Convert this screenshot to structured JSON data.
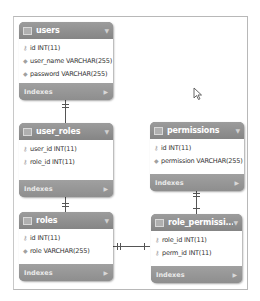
{
  "diagram": {
    "tables": [
      {
        "name": "users",
        "columns": [
          {
            "icon": "key",
            "text": "id INT(11)"
          },
          {
            "icon": "diamond",
            "text": "user_name VARCHAR(255)"
          },
          {
            "icon": "diamond",
            "text": "password VARCHAR(255)"
          }
        ],
        "indexes_label": "Indexes"
      },
      {
        "name": "user_roles",
        "columns": [
          {
            "icon": "key",
            "text": "user_id INT(11)"
          },
          {
            "icon": "key",
            "text": "role_id INT(11)"
          }
        ],
        "indexes_label": "Indexes"
      },
      {
        "name": "permissions",
        "columns": [
          {
            "icon": "key",
            "text": "id INT(11)"
          },
          {
            "icon": "diamond",
            "text": "permission VARCHAR(255)"
          }
        ],
        "indexes_label": "Indexes"
      },
      {
        "name": "roles",
        "columns": [
          {
            "icon": "key",
            "text": "id INT(11)"
          },
          {
            "icon": "diamond",
            "text": "role VARCHAR(255)"
          }
        ],
        "indexes_label": "Indexes"
      },
      {
        "name": "role_permissi...",
        "columns": [
          {
            "icon": "key",
            "text": "role_id INT(11)"
          },
          {
            "icon": "key",
            "text": "perm_id INT(11)"
          }
        ],
        "indexes_label": "Indexes"
      }
    ],
    "relationships": [
      {
        "from": "users",
        "to": "user_roles",
        "type": "one-to-many"
      },
      {
        "from": "roles",
        "to": "user_roles",
        "type": "one-to-many"
      },
      {
        "from": "permissions",
        "to": "role_permissions",
        "type": "one-to-many"
      },
      {
        "from": "roles",
        "to": "role_permissions",
        "type": "one-to-many"
      }
    ],
    "colors": {
      "header": "#8b8b8b",
      "body": "#ffffff",
      "line": "#555555",
      "frame": "#b8b8b8"
    }
  }
}
